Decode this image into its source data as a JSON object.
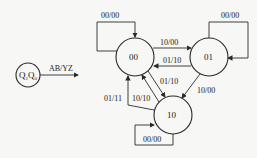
{
  "legend": {
    "node_label_main": "Q",
    "node_sub1": "1",
    "node_mid": "Q",
    "node_sub0": "0",
    "arrow_label": "AB/YZ"
  },
  "states": [
    {
      "id": "s00",
      "label": "00"
    },
    {
      "id": "s01",
      "label": "01"
    },
    {
      "id": "s10",
      "label": "10"
    }
  ],
  "transitions": [
    {
      "from": "00",
      "to": "00",
      "label": "00/00"
    },
    {
      "from": "01",
      "to": "01",
      "label": "00/00"
    },
    {
      "from": "10",
      "to": "10",
      "label": "00/00"
    },
    {
      "from": "00",
      "to": "01",
      "label": "10/00"
    },
    {
      "from": "01",
      "to": "00",
      "label": "01/10"
    },
    {
      "from": "00",
      "to": "10",
      "label": "01/10"
    },
    {
      "from": "10",
      "to": "00",
      "label": "10/10"
    },
    {
      "from": "10",
      "to": "00",
      "label": "01/11"
    },
    {
      "from": "01",
      "to": "10",
      "label": "10/00"
    }
  ]
}
